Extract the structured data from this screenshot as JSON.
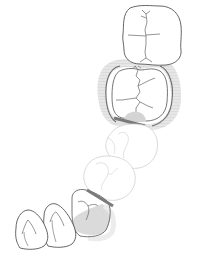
{
  "diagram": {
    "type": "dental-arch-partial-denture",
    "colors": {
      "background": "#ffffff",
      "tooth_outline": "#555555",
      "ghost_outline": "#cfcfcf",
      "fissure": "#666666",
      "denture_base": "#d9d9d9",
      "halo": "#e8e8e8",
      "rest_bar": "#7a7a7a"
    },
    "teeth": [
      {
        "id": "molar-distal",
        "state": "present"
      },
      {
        "id": "molar-clasped",
        "state": "abutment-clasped"
      },
      {
        "id": "premolar-2",
        "state": "missing-replaced"
      },
      {
        "id": "premolar-1",
        "state": "missing-replaced"
      },
      {
        "id": "canine",
        "state": "abutment-rest"
      },
      {
        "id": "lateral-incisor",
        "state": "present"
      },
      {
        "id": "central-incisor",
        "state": "present"
      }
    ],
    "components": [
      {
        "id": "clasp-ring",
        "on": "molar-clasped"
      },
      {
        "id": "occlusal-rest",
        "on": "molar-clasped"
      },
      {
        "id": "cingulum-rest",
        "on": "canine"
      }
    ]
  }
}
